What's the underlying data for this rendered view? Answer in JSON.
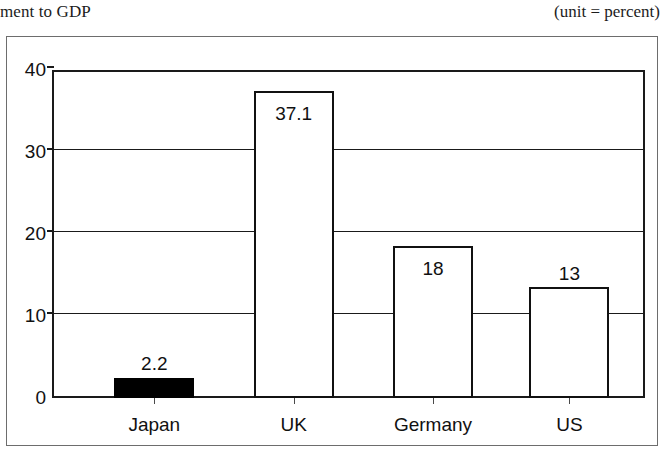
{
  "header": {
    "title_fragment": "ment to GDP",
    "unit_note": "(unit = percent)"
  },
  "chart_data": {
    "type": "bar",
    "title": "ment to GDP",
    "subtitle": "(unit = percent)",
    "xlabel": "",
    "ylabel": "",
    "ylim": [
      0,
      40
    ],
    "yticks": [
      0,
      10,
      20,
      30,
      40
    ],
    "ytick_labels": [
      "0",
      "10",
      "20",
      "30",
      "40"
    ],
    "grid": true,
    "legend": "none",
    "categories": [
      "Japan",
      "UK",
      "Germany",
      "US"
    ],
    "values": [
      2.2,
      37.1,
      18,
      13
    ],
    "value_labels": [
      "2.2",
      "37.1",
      "18",
      "13"
    ],
    "bar_styles": [
      "filled-black",
      "hollow-white",
      "hollow-white",
      "hollow-white"
    ],
    "label_positions": [
      "above",
      "inside",
      "inside",
      "above"
    ],
    "colors": {
      "bar_fill_highlight": "#000000",
      "bar_fill_default": "#ffffff",
      "bar_outline": "#111111",
      "axis": "#1a1a1a",
      "text": "#111111"
    }
  },
  "series_bars": [
    {
      "category": "Japan",
      "value": 2.2,
      "label": "2.2",
      "style": "filled",
      "label_pos": "above",
      "left_pct": 10.5,
      "width_pct": 13.5
    },
    {
      "category": "UK",
      "value": 37.1,
      "label": "37.1",
      "style": "hollow",
      "label_pos": "inside",
      "left_pct": 34.0,
      "width_pct": 13.5
    },
    {
      "category": "Germany",
      "value": 18,
      "label": "18",
      "style": "hollow",
      "label_pos": "inside",
      "left_pct": 57.5,
      "width_pct": 13.5
    },
    {
      "category": "US",
      "value": 13,
      "label": "13",
      "style": "hollow",
      "label_pos": "above",
      "left_pct": 80.5,
      "width_pct": 13.5
    }
  ],
  "bar_top_values": [
    2.5,
    37.4,
    18.5,
    13.5
  ]
}
